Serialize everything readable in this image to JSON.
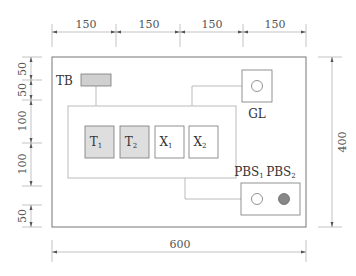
{
  "diagram": {
    "type": "control-panel-layout",
    "colors": {
      "line": "#777777",
      "thin_line": "#aaaaaa",
      "transformer_fill": "#dedede",
      "tb_fill": "#d0d0d0",
      "pbs2_fill": "#888888",
      "white": "#ffffff"
    },
    "components": {
      "tb": {
        "label": "TB"
      },
      "gl": {
        "label": "GL"
      },
      "t1": {
        "label": "T",
        "sub": "1"
      },
      "t2": {
        "label": "T",
        "sub": "2"
      },
      "x1": {
        "label": "X",
        "sub": "1"
      },
      "x2": {
        "label": "X",
        "sub": "2"
      },
      "pbs1": {
        "label": "PBS",
        "sub": "1"
      },
      "pbs2": {
        "label": "PBS",
        "sub": "2"
      }
    },
    "dimensions": {
      "top": [
        "150",
        "150",
        "150",
        "150"
      ],
      "bottom": "600",
      "right": "400",
      "left": [
        "50",
        "50",
        "100",
        "100",
        "50"
      ]
    }
  }
}
